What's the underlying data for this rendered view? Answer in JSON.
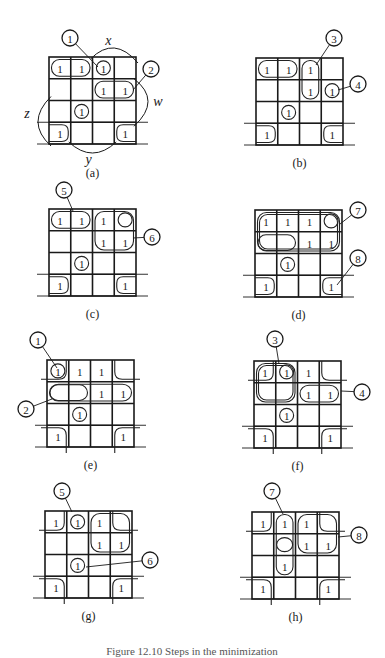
{
  "figure": {
    "caption_partial": "Figure 12.10  Steps in the minimization",
    "cell_size": 21.75,
    "one_symbol": "1",
    "variables": {
      "x": "x",
      "w": "w",
      "z": "z",
      "y": "y"
    },
    "panels": [
      {
        "id": "a",
        "label": "(a)",
        "origin": [
          49,
          57
        ],
        "ones": [
          [
            0,
            0
          ],
          [
            0,
            1
          ],
          [
            0,
            2
          ],
          [
            1,
            2
          ],
          [
            1,
            3
          ],
          [
            2,
            1
          ],
          [
            3,
            0
          ],
          [
            3,
            3
          ]
        ],
        "loops": [
          {
            "type": "h",
            "r": 0,
            "c0": 0,
            "c1": 1
          },
          {
            "type": "cell",
            "r": 0,
            "c": 2,
            "circle": true
          },
          {
            "type": "h",
            "r": 1,
            "c0": 2,
            "c1": 3
          },
          {
            "type": "cell",
            "r": 2,
            "c": 1,
            "circle": true
          },
          {
            "type": "cell",
            "r": 3,
            "c": 0
          },
          {
            "type": "cell",
            "r": 3,
            "c": 3
          }
        ],
        "callouts": [
          {
            "num": "1",
            "pos": [
              70,
              38
            ],
            "target": [
              98,
              67
            ]
          },
          {
            "num": "2",
            "pos": [
              151,
              69
            ],
            "target": [
              133,
              90
            ]
          }
        ],
        "var_arcs": true
      },
      {
        "id": "b",
        "label": "(b)",
        "origin": [
          256,
          58
        ],
        "ones": [
          [
            0,
            0
          ],
          [
            0,
            1
          ],
          [
            0,
            2
          ],
          [
            1,
            2
          ],
          [
            1,
            3
          ],
          [
            2,
            1
          ],
          [
            3,
            0
          ],
          [
            3,
            3
          ]
        ],
        "loops": [
          {
            "type": "h",
            "r": 0,
            "c0": 0,
            "c1": 1
          },
          {
            "type": "v",
            "c": 2,
            "r0": 0,
            "r1": 1
          },
          {
            "type": "cell",
            "r": 1,
            "c": 3,
            "circle": true
          },
          {
            "type": "cell",
            "r": 2,
            "c": 1,
            "circle": true
          },
          {
            "type": "cell",
            "r": 3,
            "c": 0
          },
          {
            "type": "cell",
            "r": 3,
            "c": 3
          }
        ],
        "callouts": [
          {
            "num": "3",
            "pos": [
              334,
              38
            ],
            "target": [
              316,
              65
            ]
          },
          {
            "num": "4",
            "pos": [
              358,
              84
            ],
            "target": [
              338,
              90
            ]
          }
        ]
      },
      {
        "id": "c",
        "label": "(c)",
        "origin": [
          49,
          209
        ],
        "ones": [
          [
            0,
            0
          ],
          [
            0,
            1
          ],
          [
            0,
            2
          ],
          [
            1,
            2
          ],
          [
            1,
            3
          ],
          [
            2,
            1
          ],
          [
            3,
            0
          ],
          [
            3,
            3
          ]
        ],
        "empty_circles": [
          [
            0,
            3
          ]
        ],
        "loops": [
          {
            "type": "h",
            "r": 0,
            "c0": 0,
            "c1": 1
          },
          {
            "type": "box",
            "r0": 0,
            "r1": 1,
            "c0": 2,
            "c1": 3
          },
          {
            "type": "cell",
            "r": 2,
            "c": 1,
            "circle": true
          },
          {
            "type": "cell",
            "r": 3,
            "c": 0
          },
          {
            "type": "cell",
            "r": 3,
            "c": 3
          }
        ],
        "callouts": [
          {
            "num": "5",
            "pos": [
              64,
              190
            ],
            "target": [
              73,
              211
            ]
          },
          {
            "num": "6",
            "pos": [
              152,
              237
            ],
            "target": [
              133,
              238
            ]
          }
        ]
      },
      {
        "id": "d",
        "label": "(d)",
        "origin": [
          255,
          210
        ],
        "ones": [
          [
            0,
            0
          ],
          [
            0,
            1
          ],
          [
            0,
            2
          ],
          [
            1,
            2
          ],
          [
            1,
            3
          ],
          [
            2,
            1
          ],
          [
            3,
            0
          ],
          [
            3,
            3
          ]
        ],
        "empty_circles": [
          [
            0,
            3
          ]
        ],
        "empty_ovals": [
          [
            1,
            0,
            1
          ]
        ],
        "loops": [
          {
            "type": "box",
            "r0": 0,
            "r1": 1,
            "c0": 0,
            "c1": 3,
            "double": true
          },
          {
            "type": "cell",
            "r": 2,
            "c": 1,
            "circle": true
          },
          {
            "type": "cell",
            "r": 3,
            "c": 0
          },
          {
            "type": "cell",
            "r": 3,
            "c": 3
          }
        ],
        "callouts": [
          {
            "num": "7",
            "pos": [
              358,
              210
            ],
            "target": [
              340,
              224
            ]
          },
          {
            "num": "8",
            "pos": [
              358,
              258
            ],
            "target": [
              337,
              285
            ]
          }
        ]
      },
      {
        "id": "e",
        "label": "(e)",
        "origin": [
          47,
          360
        ],
        "ones": [
          [
            0,
            0
          ],
          [
            0,
            1
          ],
          [
            0,
            2
          ],
          [
            1,
            2
          ],
          [
            1,
            3
          ],
          [
            2,
            1
          ],
          [
            3,
            0
          ],
          [
            3,
            3
          ]
        ],
        "empty_ovals": [
          [
            1,
            0,
            1
          ]
        ],
        "loops": [
          {
            "type": "cell",
            "r": 0,
            "c": 0,
            "circle": true
          },
          {
            "type": "corner",
            "which": "tl"
          },
          {
            "type": "corner",
            "which": "tr"
          },
          {
            "type": "corner",
            "which": "bl"
          },
          {
            "type": "corner",
            "which": "br"
          },
          {
            "type": "hband",
            "r0": 1,
            "r1": 1,
            "c0": 0,
            "c1": 3
          },
          {
            "type": "cell",
            "r": 2,
            "c": 1,
            "circle": true
          }
        ],
        "callouts": [
          {
            "num": "1",
            "pos": [
              38,
              340
            ],
            "target": [
              57,
              368
            ]
          },
          {
            "num": "2",
            "pos": [
              26,
              409
            ],
            "target": [
              52,
              399
            ]
          }
        ]
      },
      {
        "id": "f",
        "label": "(f)",
        "origin": [
          254,
          361
        ],
        "ones": [
          [
            0,
            0
          ],
          [
            0,
            1
          ],
          [
            0,
            2
          ],
          [
            1,
            2
          ],
          [
            1,
            3
          ],
          [
            2,
            1
          ],
          [
            3,
            0
          ],
          [
            3,
            3
          ]
        ],
        "loops": [
          {
            "type": "box",
            "r0": 0,
            "r1": 1,
            "c0": 0,
            "c1": 1,
            "double": true
          },
          {
            "type": "cell",
            "r": 0,
            "c": 1,
            "circle": true
          },
          {
            "type": "corner",
            "which": "tl"
          },
          {
            "type": "corner",
            "which": "tr"
          },
          {
            "type": "corner",
            "which": "bl"
          },
          {
            "type": "corner",
            "which": "br"
          },
          {
            "type": "hband",
            "r0": 1,
            "r1": 1,
            "c0": 2,
            "c1": 3,
            "wrap_top": true
          },
          {
            "type": "cell",
            "r": 2,
            "c": 1,
            "circle": true
          }
        ],
        "callouts": [
          {
            "num": "3",
            "pos": [
              275,
              339
            ],
            "target": [
              279,
              364
            ]
          },
          {
            "num": "4",
            "pos": [
              362,
              392
            ],
            "target": [
              341,
              391
            ]
          }
        ]
      },
      {
        "id": "g",
        "label": "(g)",
        "origin": [
          45,
          511
        ],
        "ones": [
          [
            0,
            0
          ],
          [
            0,
            1
          ],
          [
            0,
            2
          ],
          [
            1,
            2
          ],
          [
            1,
            3
          ],
          [
            2,
            1
          ],
          [
            3,
            0
          ],
          [
            3,
            3
          ]
        ],
        "loops": [
          {
            "type": "cell",
            "r": 0,
            "c": 1,
            "circle": true
          },
          {
            "type": "corner",
            "which": "tl"
          },
          {
            "type": "corner",
            "which": "tr"
          },
          {
            "type": "corner",
            "which": "bl"
          },
          {
            "type": "corner",
            "which": "br"
          },
          {
            "type": "box",
            "r0": 0,
            "r1": 1,
            "c0": 2,
            "c1": 3
          },
          {
            "type": "cell",
            "r": 2,
            "c": 1,
            "circle": true
          }
        ],
        "callouts": [
          {
            "num": "5",
            "pos": [
              62,
              491
            ],
            "target": [
              72,
              512
            ]
          },
          {
            "num": "6",
            "pos": [
              150,
              560
            ],
            "target": [
              86,
              567
            ]
          }
        ]
      },
      {
        "id": "h",
        "label": "(h)",
        "origin": [
          252,
          512
        ],
        "ones": [
          [
            0,
            0
          ],
          [
            0,
            1
          ],
          [
            0,
            2
          ],
          [
            1,
            2
          ],
          [
            1,
            3
          ],
          [
            2,
            1
          ],
          [
            3,
            0
          ],
          [
            3,
            3
          ]
        ],
        "empty_ovals_single": [
          [
            1,
            1
          ]
        ],
        "loops": [
          {
            "type": "corner",
            "which": "tl"
          },
          {
            "type": "corner",
            "which": "tr"
          },
          {
            "type": "corner",
            "which": "bl"
          },
          {
            "type": "corner",
            "which": "br"
          },
          {
            "type": "v",
            "c": 1,
            "r0": 0,
            "r1": 2
          },
          {
            "type": "box",
            "r0": 0,
            "r1": 1,
            "c0": 2,
            "c1": 3
          }
        ],
        "callouts": [
          {
            "num": "7",
            "pos": [
              272,
              491
            ],
            "target": [
              283,
              514
            ]
          },
          {
            "num": "8",
            "pos": [
              359,
              535
            ],
            "target": [
              338,
              537
            ]
          }
        ]
      }
    ]
  }
}
